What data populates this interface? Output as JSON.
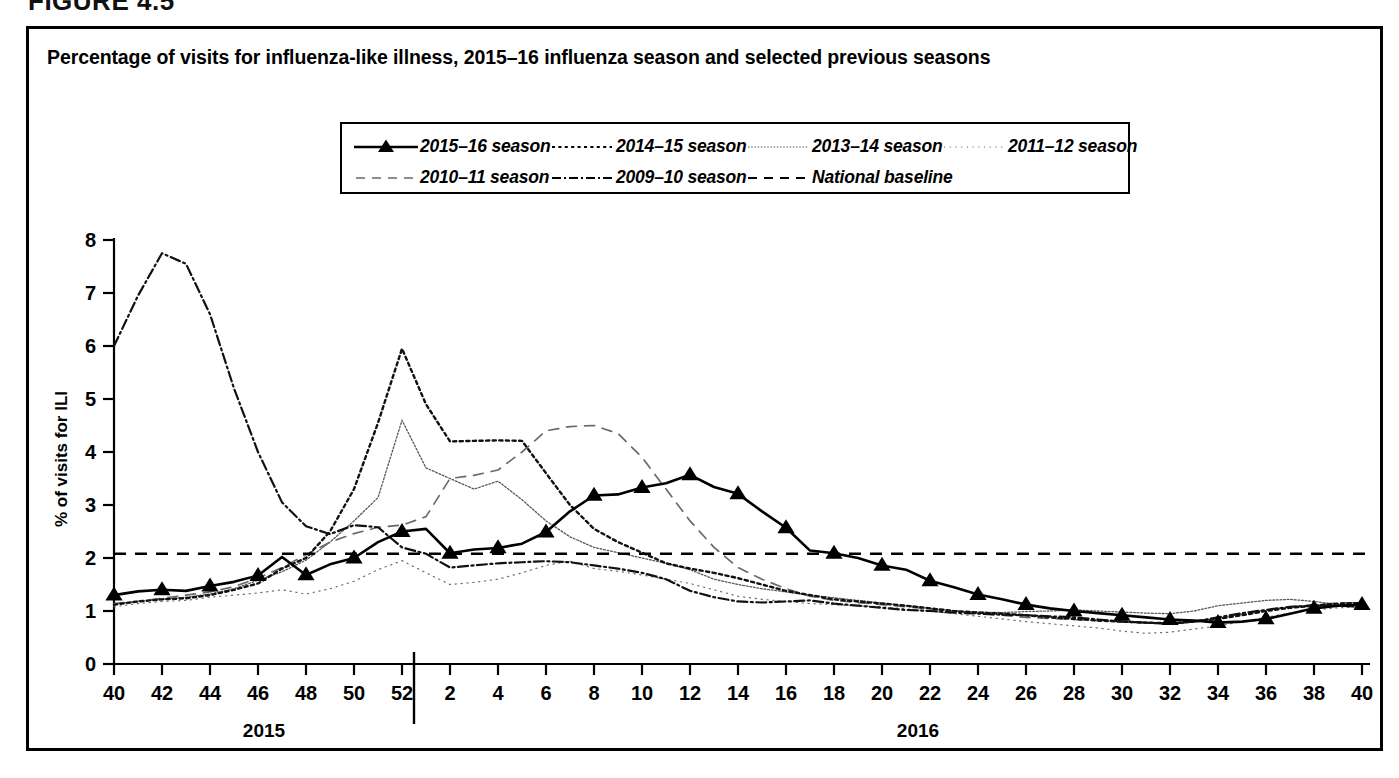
{
  "figure": {
    "label": "FIGURE 4.5",
    "panel_title": "Percentage of visits for influenza-like illness, 2015–16 influenza season and selected previous seasons"
  },
  "axes": {
    "ylabel": "% of visits for ILI",
    "xlabel": "Surveillance Week",
    "yticks": [
      "0",
      "1",
      "2",
      "3",
      "4",
      "5",
      "6",
      "7",
      "8"
    ],
    "xticks": [
      "40",
      "42",
      "44",
      "46",
      "48",
      "50",
      "52",
      "2",
      "4",
      "6",
      "8",
      "10",
      "12",
      "14",
      "16",
      "18",
      "20",
      "22",
      "24",
      "26",
      "28",
      "30",
      "32",
      "34",
      "36",
      "38",
      "40"
    ],
    "year_left": "2015",
    "year_right": "2016"
  },
  "legend": {
    "row1": [
      {
        "label": "2015–16 season",
        "style": "solid-triangle"
      },
      {
        "label": "2014–15 season",
        "style": "dotted-heavy"
      },
      {
        "label": "2013–14 season",
        "style": "dotted-fine"
      },
      {
        "label": "2011–12 season",
        "style": "dotted-sparse"
      }
    ],
    "row2": [
      {
        "label": "2010–11 season",
        "style": "dashed-long"
      },
      {
        "label": "2009–10 season",
        "style": "dash-dot"
      },
      {
        "label": "National baseline",
        "style": "dashed-baseline"
      }
    ]
  },
  "chart_data": {
    "type": "line",
    "title": "Percentage of visits for influenza-like illness, 2015–16 influenza season and selected previous seasons",
    "xlabel": "Surveillance Week",
    "ylabel": "% of visits for ILI",
    "xlim": [
      40,
      92
    ],
    "ylim": [
      0,
      8
    ],
    "grid": false,
    "legend_position": "top-center",
    "x_note": "Weeks 40-52 are calendar year 2015; weeks 1-40 (plotted as 53-92) are calendar year 2016",
    "x": [
      40,
      41,
      42,
      43,
      44,
      45,
      46,
      47,
      48,
      49,
      50,
      51,
      52,
      53,
      54,
      55,
      56,
      57,
      58,
      59,
      60,
      61,
      62,
      63,
      64,
      65,
      66,
      67,
      68,
      69,
      70,
      71,
      72,
      73,
      74,
      75,
      76,
      77,
      78,
      79,
      80,
      81,
      82,
      83,
      84,
      85,
      86,
      87,
      88,
      89,
      90,
      91,
      92
    ],
    "x_week_labels": [
      "40",
      "41",
      "42",
      "43",
      "44",
      "45",
      "46",
      "47",
      "48",
      "49",
      "50",
      "51",
      "52",
      "1",
      "2",
      "3",
      "4",
      "5",
      "6",
      "7",
      "8",
      "9",
      "10",
      "11",
      "12",
      "13",
      "14",
      "15",
      "16",
      "17",
      "18",
      "19",
      "20",
      "21",
      "22",
      "23",
      "24",
      "25",
      "26",
      "27",
      "28",
      "29",
      "30",
      "31",
      "32",
      "33",
      "34",
      "35",
      "36",
      "37",
      "38",
      "39",
      "40"
    ],
    "series": [
      {
        "name": "2015–16 season",
        "style": "solid-triangle",
        "markers_every": 2,
        "values": [
          1.3,
          1.37,
          1.4,
          1.38,
          1.47,
          1.55,
          1.67,
          2.02,
          1.68,
          1.88,
          2.0,
          2.3,
          2.5,
          2.55,
          2.09,
          2.16,
          2.19,
          2.27,
          2.49,
          2.88,
          3.18,
          3.2,
          3.33,
          3.41,
          3.57,
          3.34,
          3.21,
          2.88,
          2.57,
          2.14,
          2.09,
          2.0,
          1.86,
          1.78,
          1.57,
          1.45,
          1.31,
          1.22,
          1.12,
          1.05,
          1.0,
          0.96,
          0.92,
          0.88,
          0.84,
          0.82,
          0.78,
          0.8,
          0.85,
          0.95,
          1.05,
          1.1,
          1.12
        ]
      },
      {
        "name": "2014–15 season",
        "style": "dotted-heavy",
        "values": [
          1.12,
          1.18,
          1.22,
          1.24,
          1.3,
          1.4,
          1.52,
          1.8,
          2.0,
          2.5,
          3.3,
          4.55,
          5.95,
          4.9,
          4.2,
          4.21,
          4.22,
          4.21,
          3.6,
          3.0,
          2.55,
          2.3,
          2.1,
          1.9,
          1.8,
          1.72,
          1.62,
          1.5,
          1.38,
          1.3,
          1.22,
          1.18,
          1.14,
          1.1,
          1.05,
          1.0,
          0.97,
          0.95,
          0.92,
          0.88,
          0.85,
          0.82,
          0.8,
          0.78,
          0.77,
          0.8,
          0.85,
          0.92,
          1.0,
          1.06,
          1.1,
          1.14,
          1.15
        ]
      },
      {
        "name": "2013–14 season",
        "style": "dotted-fine",
        "values": [
          1.13,
          1.18,
          1.22,
          1.26,
          1.32,
          1.42,
          1.58,
          1.74,
          1.96,
          2.3,
          2.7,
          3.14,
          4.6,
          3.7,
          3.5,
          3.3,
          3.45,
          3.1,
          2.7,
          2.4,
          2.2,
          2.1,
          2.0,
          1.9,
          1.78,
          1.6,
          1.5,
          1.42,
          1.36,
          1.3,
          1.25,
          1.2,
          1.15,
          1.1,
          1.05,
          1.0,
          0.98,
          0.97,
          0.99,
          1.0,
          1.02,
          1.0,
          0.98,
          0.96,
          0.95,
          1.0,
          1.1,
          1.15,
          1.2,
          1.22,
          1.18,
          1.12,
          1.1
        ]
      },
      {
        "name": "2011–12 season",
        "style": "dotted-sparse",
        "values": [
          1.08,
          1.14,
          1.18,
          1.2,
          1.26,
          1.3,
          1.34,
          1.4,
          1.32,
          1.42,
          1.56,
          1.78,
          1.95,
          1.72,
          1.5,
          1.54,
          1.6,
          1.72,
          1.86,
          1.94,
          1.8,
          1.75,
          1.68,
          1.6,
          1.52,
          1.4,
          1.28,
          1.22,
          1.18,
          1.14,
          1.12,
          1.1,
          1.08,
          1.04,
          1.0,
          0.95,
          0.9,
          0.85,
          0.8,
          0.76,
          0.72,
          0.68,
          0.62,
          0.58,
          0.6,
          0.66,
          0.72,
          0.8,
          0.88,
          0.96,
          1.02,
          1.06,
          1.08
        ]
      },
      {
        "name": "2010–11 season",
        "style": "dashed-long",
        "values": [
          1.14,
          1.18,
          1.24,
          1.3,
          1.36,
          1.46,
          1.62,
          1.82,
          2.06,
          2.3,
          2.46,
          2.58,
          2.62,
          2.78,
          3.5,
          3.56,
          3.66,
          4.0,
          4.4,
          4.48,
          4.5,
          4.35,
          3.9,
          3.3,
          2.7,
          2.2,
          1.82,
          1.6,
          1.42,
          1.28,
          1.2,
          1.16,
          1.12,
          1.08,
          1.04,
          1.0,
          0.96,
          0.92,
          0.88,
          0.86,
          0.84,
          0.82,
          0.8,
          0.78,
          0.76,
          0.8,
          0.86,
          0.94,
          1.02,
          1.08,
          1.12,
          1.15,
          1.16
        ]
      },
      {
        "name": "2009–10 season",
        "style": "dash-dot",
        "values": [
          6.0,
          6.95,
          7.75,
          7.55,
          6.6,
          5.2,
          4.0,
          3.05,
          2.6,
          2.45,
          2.62,
          2.58,
          2.2,
          2.08,
          1.82,
          1.86,
          1.9,
          1.92,
          1.94,
          1.92,
          1.86,
          1.8,
          1.72,
          1.6,
          1.38,
          1.26,
          1.18,
          1.16,
          1.18,
          1.2,
          1.14,
          1.1,
          1.06,
          1.02,
          1.0,
          0.97,
          0.95,
          0.93,
          0.92,
          0.9,
          0.88,
          0.84,
          0.8,
          0.78,
          0.76,
          0.8,
          0.88,
          0.96,
          1.02,
          1.08,
          1.1,
          1.1,
          1.08
        ]
      },
      {
        "name": "National baseline",
        "style": "dashed-baseline",
        "constant": 2.08
      }
    ]
  }
}
